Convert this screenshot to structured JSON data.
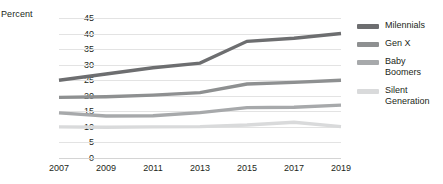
{
  "axis_unit_label": "Percent",
  "legend": {
    "items": [
      {
        "label": "Milennials",
        "color": "#6d6e70"
      },
      {
        "label": "Gen X",
        "color": "#8e9091"
      },
      {
        "label": "Baby Boomers",
        "color": "#a7a9ab"
      },
      {
        "label": "Silent Generation",
        "color": "#d9dadb"
      }
    ]
  },
  "chart_data": {
    "type": "line",
    "title": "",
    "xlabel": "",
    "ylabel": "Percent",
    "categories": [
      "2007",
      "2009",
      "2011",
      "2013",
      "2015",
      "2017",
      "2019"
    ],
    "x": [
      2007,
      2009,
      2011,
      2013,
      2015,
      2017,
      2019
    ],
    "yticks": [
      0,
      5,
      10,
      15,
      20,
      25,
      30,
      35,
      40,
      45
    ],
    "ylim": [
      0,
      45
    ],
    "grid": true,
    "legend_position": "right",
    "series": [
      {
        "name": "Milennials",
        "color": "#6d6e70",
        "values": [
          25.0,
          27.0,
          29.0,
          30.5,
          37.5,
          38.5,
          40.0
        ]
      },
      {
        "name": "Gen X",
        "color": "#8e9091",
        "values": [
          19.5,
          19.7,
          20.2,
          21.0,
          23.8,
          24.3,
          25.0
        ]
      },
      {
        "name": "Baby Boomers",
        "color": "#a7a9ab",
        "values": [
          14.5,
          13.5,
          13.6,
          14.6,
          16.2,
          16.3,
          17.0
        ]
      },
      {
        "name": "Silent Generation",
        "color": "#d9dadb",
        "values": [
          10.0,
          9.9,
          10.0,
          10.1,
          10.6,
          11.5,
          10.1
        ]
      }
    ]
  }
}
